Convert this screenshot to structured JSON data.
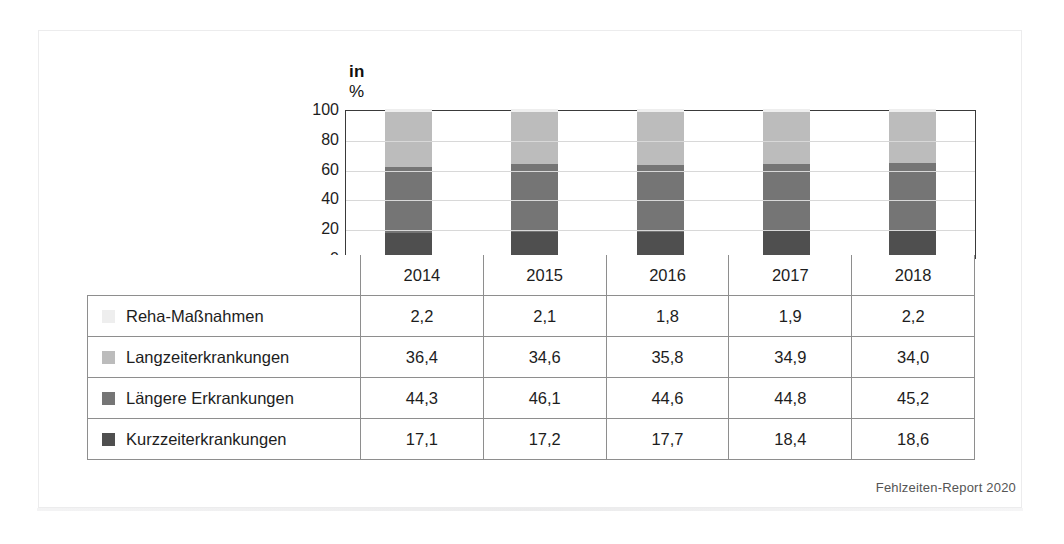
{
  "figure": {
    "axis_title_prefix": "in",
    "axis_title_unit": "%",
    "source_note": "Fehlzeiten-Report 2020"
  },
  "chart_data": {
    "type": "bar",
    "title": "",
    "subtitle": "",
    "xlabel": "",
    "ylabel": "in %",
    "ylim": [
      0,
      100
    ],
    "yticks": [
      "0",
      "20",
      "40",
      "60",
      "80",
      "100"
    ],
    "grid": true,
    "legend_position": "left-table",
    "stacked": true,
    "categories": [
      "2014",
      "2015",
      "2016",
      "2017",
      "2018"
    ],
    "series": [
      {
        "name": "Reha-Maßnahmen",
        "color": "#eeeeee",
        "values": [
          2.2,
          2.1,
          1.8,
          1.9,
          2.2
        ],
        "labels": [
          "2,2",
          "2,1",
          "1,8",
          "1,9",
          "2,2"
        ]
      },
      {
        "name": "Langzeiterkrankungen",
        "color": "#bcbcbc",
        "values": [
          36.4,
          34.6,
          35.8,
          34.9,
          34.0
        ],
        "labels": [
          "36,4",
          "34,6",
          "35,8",
          "34,9",
          "34,0"
        ]
      },
      {
        "name": "Längere Erkrankungen",
        "color": "#757575",
        "values": [
          44.3,
          46.1,
          44.6,
          44.8,
          45.2
        ],
        "labels": [
          "44,3",
          "46,1",
          "44,6",
          "44,8",
          "45,2"
        ]
      },
      {
        "name": "Kurzzeiterkrankungen",
        "color": "#4f4f4f",
        "values": [
          17.1,
          17.2,
          17.7,
          18.4,
          18.6
        ],
        "labels": [
          "17,1",
          "17,2",
          "17,7",
          "18,4",
          "18,6"
        ]
      }
    ]
  }
}
